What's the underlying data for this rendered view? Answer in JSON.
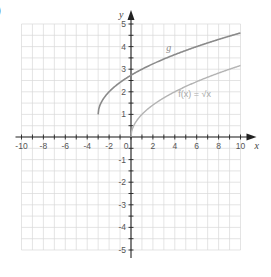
{
  "part_label": ")",
  "chart_data": {
    "type": "line",
    "title": "",
    "xlabel": "x",
    "ylabel": "y",
    "xlim": [
      -10,
      10
    ],
    "ylim": [
      -5,
      5
    ],
    "grid": true,
    "x_ticks": [
      -10,
      -8,
      -6,
      -4,
      -2,
      0,
      2,
      4,
      6,
      8,
      10
    ],
    "x_tick_labels": [
      "-10",
      "-8",
      "-6",
      "-4",
      "-2",
      "0",
      "2",
      "4",
      "6",
      "8",
      "10"
    ],
    "y_ticks": [
      -5,
      -4,
      -3,
      -2,
      -1,
      1,
      2,
      3,
      4,
      5
    ],
    "y_tick_labels": [
      "-5",
      "-4",
      "-3",
      "-2",
      "-1",
      "1",
      "2",
      "3",
      "4",
      "5"
    ],
    "series": [
      {
        "name": "g",
        "label": "g",
        "expression": "sqrt(x+3)+1",
        "color": "#8a8a8a",
        "x": [
          -3,
          -2,
          -1,
          0,
          1,
          2,
          4,
          6,
          8,
          10
        ],
        "y": [
          1,
          2,
          3,
          2.73,
          3,
          3.24,
          3.65,
          4,
          4.32,
          4.61
        ]
      },
      {
        "name": "f",
        "label": "f(x) = √x",
        "expression": "sqrt(x)",
        "color": "#b3b3b3",
        "x": [
          0,
          1,
          2,
          4,
          6,
          8,
          10
        ],
        "y": [
          0,
          1,
          1.41,
          2,
          2.45,
          2.83,
          3.16
        ]
      }
    ],
    "annotations": [
      {
        "text": "g",
        "x": 4.5,
        "y": 3.9
      },
      {
        "text": "f(x) = √x",
        "x": 5.5,
        "y": 1.8
      }
    ]
  }
}
